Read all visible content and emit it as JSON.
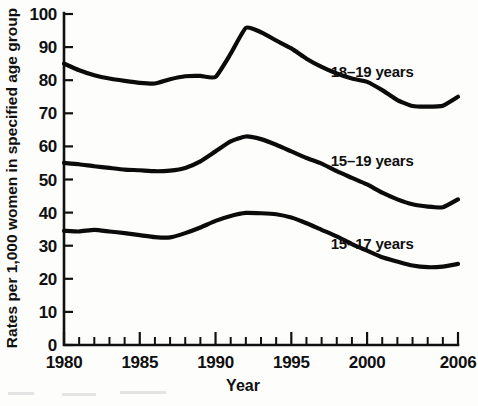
{
  "chart_data": {
    "type": "line",
    "title": "",
    "xlabel": "Year",
    "ylabel": "Rates per 1,000 women in specified age group",
    "xlim": [
      1980,
      2006
    ],
    "ylim": [
      0,
      100
    ],
    "ytick_labels": [
      "0",
      "10",
      "20",
      "30",
      "40",
      "50",
      "60",
      "70",
      "80",
      "90",
      "100"
    ],
    "ytick_values": [
      0,
      10,
      20,
      30,
      40,
      50,
      60,
      70,
      80,
      90,
      100
    ],
    "xtick_labels": [
      "1980",
      "1985",
      "1990",
      "1995",
      "2000",
      "2006"
    ],
    "xtick_values": [
      1980,
      1985,
      1990,
      1995,
      2000,
      2006
    ],
    "minor_xticks_every": 1,
    "grid": false,
    "legend_position": "inline-right-of-series",
    "x": [
      1980,
      1981,
      1982,
      1983,
      1984,
      1985,
      1986,
      1987,
      1988,
      1989,
      1990,
      1991,
      1992,
      1993,
      1994,
      1995,
      1996,
      1997,
      1998,
      1999,
      2000,
      2001,
      2002,
      2003,
      2004,
      2005,
      2006
    ],
    "series": [
      {
        "name": "18-19 years",
        "label": "18–19 years",
        "label_x": 1997.6,
        "label_y": 82.5,
        "values": [
          85.0,
          83.0,
          81.5,
          80.5,
          79.8,
          79.2,
          79.0,
          80.3,
          81.2,
          81.3,
          81.0,
          88.0,
          95.8,
          94.5,
          92.0,
          89.6,
          86.5,
          84.0,
          82.0,
          80.5,
          79.5,
          77.0,
          74.0,
          72.2,
          72.0,
          72.3,
          75.0
        ]
      },
      {
        "name": "15-19 years",
        "label": "15–19 years",
        "label_x": 1997.6,
        "label_y": 55.5,
        "values": [
          55.0,
          54.6,
          54.0,
          53.5,
          53.0,
          52.8,
          52.5,
          52.7,
          53.5,
          55.5,
          58.5,
          61.5,
          63.0,
          62.2,
          60.5,
          58.5,
          56.5,
          54.8,
          52.5,
          50.5,
          48.5,
          46.0,
          44.0,
          42.5,
          41.8,
          41.6,
          44.0
        ]
      },
      {
        "name": "15-17 years",
        "label": "15–17 years",
        "label_x": 1997.6,
        "label_y": 30.5,
        "values": [
          34.5,
          34.3,
          34.8,
          34.3,
          33.8,
          33.2,
          32.6,
          32.5,
          33.8,
          35.5,
          37.5,
          39.0,
          39.9,
          39.8,
          39.5,
          38.5,
          36.8,
          34.8,
          32.8,
          30.5,
          28.5,
          26.5,
          25.2,
          24.0,
          23.5,
          23.7,
          24.5
        ]
      }
    ]
  },
  "axes": {
    "y_title": "Rates per 1,000 women in specified age group",
    "x_title": "Year"
  }
}
